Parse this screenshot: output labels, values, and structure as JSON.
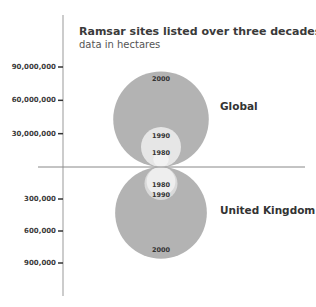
{
  "chart_data": {
    "type": "bubble",
    "title": "Ramsar sites listed over three decades",
    "subtitle": "data in hectares",
    "xlabel": "",
    "ylabel": "",
    "grid": false,
    "upper_axis": {
      "series": "Global",
      "ticks": [
        30000000,
        60000000,
        90000000
      ],
      "tick_labels": [
        "30,000,000",
        "60,000,000",
        "90,000,000"
      ],
      "range": [
        0,
        95000000
      ]
    },
    "lower_axis": {
      "series": "United Kingdom",
      "ticks": [
        300000,
        600000,
        900000
      ],
      "tick_labels": [
        "300,000",
        "600,000",
        "900,000"
      ],
      "range": [
        0,
        1000000
      ]
    },
    "series": [
      {
        "name": "Global",
        "direction": "up",
        "points": [
          {
            "year": "2000",
            "value": 86000000,
            "color": "#b3b3b3"
          },
          {
            "year": "1990",
            "value": 36000000,
            "color": "#e6e6e6"
          },
          {
            "year": "1980",
            "value": 14000000,
            "color": "#f2f2f2"
          }
        ]
      },
      {
        "name": "United Kingdom",
        "direction": "down",
        "points": [
          {
            "year": "2000",
            "value": 860000,
            "color": "#b3b3b3"
          },
          {
            "year": "1990",
            "value": 310000,
            "color": "#d9d9d9"
          },
          {
            "year": "1980",
            "value": 270000,
            "color": "#eeeeee"
          }
        ]
      }
    ]
  }
}
